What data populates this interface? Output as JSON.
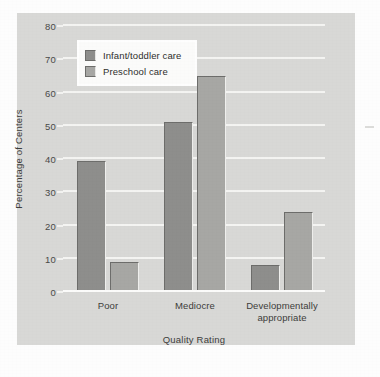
{
  "chart_data": {
    "type": "bar",
    "title": "",
    "xlabel": "Quality Rating",
    "ylabel": "Percentage of Centers",
    "categories": [
      "Poor",
      "Mediocre",
      "Developmentally\nappropriate"
    ],
    "series": [
      {
        "name": "Infant/toddler care",
        "values": [
          39.5,
          51,
          8
        ]
      },
      {
        "name": "Preschool care",
        "values": [
          9,
          65,
          24
        ]
      }
    ],
    "ylim": [
      0,
      80
    ],
    "yticks": [
      0,
      10,
      20,
      30,
      40,
      50,
      60,
      70,
      80
    ],
    "ytick_labels": [
      "0",
      "10",
      "20",
      "30",
      "40",
      "50",
      "60",
      "70",
      "80"
    ],
    "grid": true,
    "legend_position": "upper left",
    "colors": {
      "series0": "#8e8e8c",
      "series1": "#a7a7a4",
      "panel_background": "#d8d8d6",
      "gridline": "#f4f4f2",
      "text": "#3d3d3b"
    }
  }
}
